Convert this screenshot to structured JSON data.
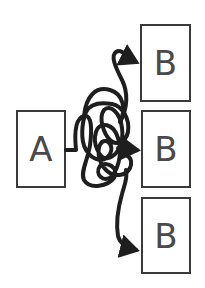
{
  "diagram": {
    "source": {
      "label": "A"
    },
    "targets": [
      {
        "label": "B"
      },
      {
        "label": "B"
      },
      {
        "label": "B"
      }
    ],
    "connector": {
      "style": "tangled-line",
      "color": "#1e1e1e",
      "arrow_count": 3
    }
  }
}
